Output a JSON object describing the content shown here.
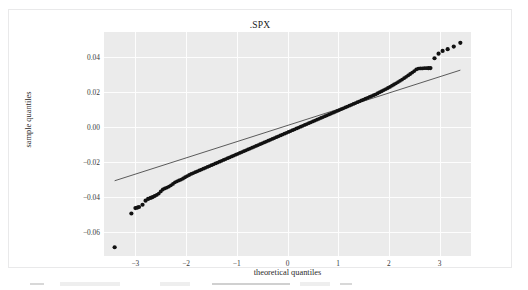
{
  "chart_data": {
    "type": "scatter",
    "title": ".SPX",
    "xlabel": "theoretical quantiles",
    "ylabel": "sample quantiles",
    "xlim": [
      -3.62,
      3.62
    ],
    "ylim": [
      -0.0735,
      0.0545
    ],
    "grid": true,
    "legend": null,
    "xticks": [
      -3,
      -2,
      -1,
      0,
      1,
      2,
      3
    ],
    "xticklabels": [
      "−3",
      "−2",
      "−1",
      "0",
      "1",
      "2",
      "3"
    ],
    "yticks": [
      0.04,
      0.02,
      0.0,
      -0.02,
      -0.04,
      -0.06
    ],
    "yticklabels": [
      "0.04",
      "0.02",
      "0.00",
      "−0.02",
      "−0.04",
      "−0.06"
    ],
    "series": [
      {
        "name": "sample quantiles",
        "type": "scatter",
        "marker": "circle",
        "color": "#111111",
        "x": [
          -3.41,
          -3.08,
          -3.0,
          -2.96,
          -2.93,
          -2.86,
          -2.8,
          -2.75,
          -2.7,
          -2.66,
          -2.62,
          -2.58,
          -2.54,
          -2.5,
          -2.46,
          -2.42,
          -2.38,
          -2.34,
          -2.3,
          -2.26,
          -2.22,
          -2.18,
          -2.14,
          -2.1,
          -2.06,
          -2.02,
          -1.98,
          -1.94,
          -1.9,
          -1.86,
          -1.82,
          -1.78,
          -1.74,
          -1.7,
          -1.66,
          -1.62,
          -1.58,
          -1.54,
          -1.5,
          -1.46,
          -1.42,
          -1.38,
          -1.34,
          -1.3,
          -1.26,
          -1.22,
          -1.18,
          -1.14,
          -1.1,
          -1.06,
          -1.02,
          -0.98,
          -0.94,
          -0.9,
          -0.86,
          -0.82,
          -0.78,
          -0.74,
          -0.7,
          -0.66,
          -0.62,
          -0.58,
          -0.54,
          -0.5,
          -0.46,
          -0.42,
          -0.38,
          -0.34,
          -0.3,
          -0.26,
          -0.22,
          -0.18,
          -0.14,
          -0.1,
          -0.06,
          -0.02,
          0.02,
          0.06,
          0.1,
          0.14,
          0.18,
          0.22,
          0.26,
          0.3,
          0.34,
          0.38,
          0.42,
          0.46,
          0.5,
          0.54,
          0.58,
          0.62,
          0.66,
          0.7,
          0.74,
          0.78,
          0.82,
          0.86,
          0.9,
          0.94,
          0.98,
          1.02,
          1.06,
          1.1,
          1.14,
          1.18,
          1.22,
          1.26,
          1.3,
          1.34,
          1.38,
          1.42,
          1.46,
          1.5,
          1.54,
          1.58,
          1.62,
          1.66,
          1.7,
          1.74,
          1.78,
          1.82,
          1.86,
          1.9,
          1.94,
          1.98,
          2.02,
          2.06,
          2.1,
          2.14,
          2.18,
          2.22,
          2.26,
          2.3,
          2.34,
          2.38,
          2.42,
          2.46,
          2.5,
          2.54,
          2.58,
          2.62,
          2.66,
          2.7,
          2.74,
          2.78,
          2.82,
          2.9,
          2.98,
          3.06,
          3.16,
          3.28,
          3.41
        ],
        "y": [
          -0.0685,
          -0.0492,
          -0.0461,
          -0.0458,
          -0.0455,
          -0.0442,
          -0.0419,
          -0.0409,
          -0.0403,
          -0.0398,
          -0.0392,
          -0.0386,
          -0.0378,
          -0.0366,
          -0.0355,
          -0.0349,
          -0.0344,
          -0.0338,
          -0.0331,
          -0.0323,
          -0.0314,
          -0.0308,
          -0.0303,
          -0.0298,
          -0.0292,
          -0.0285,
          -0.0278,
          -0.0272,
          -0.0266,
          -0.0261,
          -0.0256,
          -0.0251,
          -0.0246,
          -0.0241,
          -0.0236,
          -0.0231,
          -0.0226,
          -0.0221,
          -0.0216,
          -0.0211,
          -0.0206,
          -0.0201,
          -0.0196,
          -0.0191,
          -0.0186,
          -0.0181,
          -0.0176,
          -0.0171,
          -0.0166,
          -0.0161,
          -0.0156,
          -0.0151,
          -0.0146,
          -0.0141,
          -0.0136,
          -0.0131,
          -0.0126,
          -0.0121,
          -0.0116,
          -0.0111,
          -0.0106,
          -0.0101,
          -0.0096,
          -0.0091,
          -0.0086,
          -0.0081,
          -0.0076,
          -0.0071,
          -0.0066,
          -0.0061,
          -0.0056,
          -0.0051,
          -0.0046,
          -0.0041,
          -0.0036,
          -0.0031,
          -0.0026,
          -0.0021,
          -0.0016,
          -0.0011,
          -0.0006,
          -0.0001,
          0.0004,
          0.0009,
          0.0014,
          0.0019,
          0.0024,
          0.0029,
          0.0034,
          0.0039,
          0.0044,
          0.0049,
          0.0054,
          0.0059,
          0.0064,
          0.0069,
          0.0074,
          0.0079,
          0.0084,
          0.0089,
          0.0094,
          0.0099,
          0.0104,
          0.0109,
          0.0114,
          0.0119,
          0.0124,
          0.0129,
          0.0134,
          0.0139,
          0.0144,
          0.0149,
          0.0154,
          0.0159,
          0.0164,
          0.0169,
          0.0174,
          0.0179,
          0.0184,
          0.0189,
          0.0195,
          0.0201,
          0.0207,
          0.0213,
          0.0219,
          0.0225,
          0.0231,
          0.0238,
          0.0245,
          0.0252,
          0.0259,
          0.0266,
          0.0273,
          0.0281,
          0.0289,
          0.0297,
          0.0305,
          0.0313,
          0.0322,
          0.0331,
          0.0336,
          0.0337,
          0.0337,
          0.0338,
          0.0338,
          0.0338,
          0.0339,
          0.0395,
          0.0421,
          0.0437,
          0.0447,
          0.0462,
          0.0483
        ]
      },
      {
        "name": "reference line",
        "type": "line",
        "color": "#4a4a4a",
        "x": [
          -3.41,
          3.41
        ],
        "y": [
          -0.0305,
          0.0327
        ]
      }
    ]
  },
  "card": {
    "border_color": "#e9e9ea",
    "background": "#ffffff"
  },
  "plot": {
    "background": "#ebebeb",
    "gridline_color": "#fdfdfd"
  }
}
